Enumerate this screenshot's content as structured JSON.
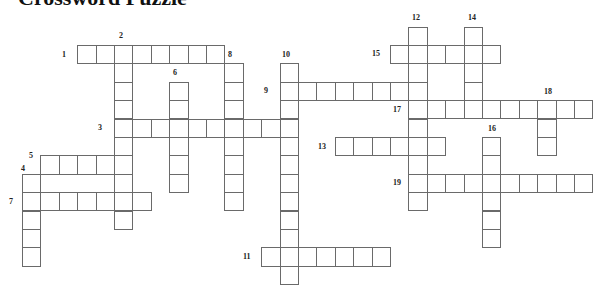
{
  "title": "Crossword Puzzle",
  "grid": {
    "x0": 22,
    "y0": 26.5,
    "cell": 18.4
  },
  "words": [
    {
      "num": "1",
      "dir": "across",
      "row": 1,
      "col": 3,
      "len": 8
    },
    {
      "num": "2",
      "dir": "down",
      "row": 1,
      "col": 5,
      "len": 10
    },
    {
      "num": "3",
      "dir": "across",
      "row": 5,
      "col": 5,
      "len": 10
    },
    {
      "num": "4",
      "dir": "down",
      "row": 8,
      "col": 0,
      "len": 5
    },
    {
      "num": "5",
      "dir": "across",
      "row": 7,
      "col": 1,
      "len": 5
    },
    {
      "num": "6",
      "dir": "down",
      "row": 3,
      "col": 8,
      "len": 6
    },
    {
      "num": "7",
      "dir": "across",
      "row": 9,
      "col": 0,
      "len": 7
    },
    {
      "num": "8",
      "dir": "down",
      "row": 2,
      "col": 11,
      "len": 8
    },
    {
      "num": "9",
      "dir": "across",
      "row": 3,
      "col": 14,
      "len": 8
    },
    {
      "num": "10",
      "dir": "down",
      "row": 2,
      "col": 14,
      "len": 12
    },
    {
      "num": "11",
      "dir": "across",
      "row": 12,
      "col": 13,
      "len": 7
    },
    {
      "num": "12",
      "dir": "down",
      "row": 0,
      "col": 21,
      "len": 10
    },
    {
      "num": "13",
      "dir": "across",
      "row": 6,
      "col": 17,
      "len": 6
    },
    {
      "num": "14",
      "dir": "down",
      "row": 0,
      "col": 24,
      "len": 5
    },
    {
      "num": "15",
      "dir": "across",
      "row": 1,
      "col": 20,
      "len": 6
    },
    {
      "num": "16",
      "dir": "down",
      "row": 6,
      "col": 25,
      "len": 6
    },
    {
      "num": "17",
      "dir": "across",
      "row": 4,
      "col": 21,
      "len": 10
    },
    {
      "num": "18",
      "dir": "down",
      "row": 4,
      "col": 28,
      "len": 3
    },
    {
      "num": "19",
      "dir": "across",
      "row": 8,
      "col": 21,
      "len": 10
    }
  ],
  "labels": [
    {
      "num": "1",
      "x": 62,
      "y": 51
    },
    {
      "num": "2",
      "x": 119,
      "y": 32
    },
    {
      "num": "3",
      "x": 98,
      "y": 124
    },
    {
      "num": "4",
      "x": 21,
      "y": 165
    },
    {
      "num": "5",
      "x": 29,
      "y": 152
    },
    {
      "num": "6",
      "x": 173,
      "y": 69
    },
    {
      "num": "7",
      "x": 9,
      "y": 198
    },
    {
      "num": "8",
      "x": 228,
      "y": 51
    },
    {
      "num": "9",
      "x": 264,
      "y": 87
    },
    {
      "num": "10",
      "x": 282,
      "y": 51
    },
    {
      "num": "11",
      "x": 243,
      "y": 253
    },
    {
      "num": "12",
      "x": 412,
      "y": 14
    },
    {
      "num": "13",
      "x": 318,
      "y": 143
    },
    {
      "num": "14",
      "x": 468,
      "y": 14
    },
    {
      "num": "15",
      "x": 372,
      "y": 50
    },
    {
      "num": "16",
      "x": 488,
      "y": 125
    },
    {
      "num": "17",
      "x": 393,
      "y": 106
    },
    {
      "num": "18",
      "x": 544,
      "y": 88
    },
    {
      "num": "19",
      "x": 393,
      "y": 179
    }
  ]
}
